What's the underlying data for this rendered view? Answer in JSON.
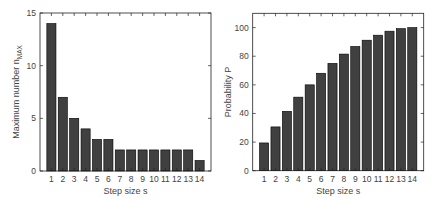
{
  "chart_data": [
    {
      "type": "bar",
      "title": "",
      "xlabel": "Step size s",
      "ylabel": "Maximum number n",
      "ylabel_subscript": "MAX",
      "categories": [
        "1",
        "2",
        "3",
        "4",
        "5",
        "6",
        "7",
        "8",
        "9",
        "10",
        "11",
        "12",
        "13",
        "14"
      ],
      "values": [
        14,
        7,
        5,
        4,
        3,
        3,
        2,
        2,
        2,
        2,
        2,
        2,
        2,
        1
      ],
      "ylim": [
        0,
        15
      ],
      "yticks": [
        0,
        5,
        10,
        15
      ],
      "xlim": [
        0,
        15
      ],
      "grid": false,
      "legend": null,
      "bar_color": "#404040",
      "edge_color": "#000000"
    },
    {
      "type": "bar",
      "title": "",
      "xlabel": "Step size s",
      "ylabel": "Probability P",
      "categories": [
        "1",
        "2",
        "3",
        "4",
        "5",
        "6",
        "7",
        "8",
        "9",
        "10",
        "11",
        "12",
        "13",
        "14"
      ],
      "values": [
        19.4,
        30.6,
        41.5,
        51.4,
        60.0,
        68.1,
        75.0,
        81.5,
        86.8,
        91.2,
        94.7,
        97.5,
        99.3,
        100
      ],
      "ylim": [
        0,
        110
      ],
      "yticks": [
        0,
        20,
        40,
        60,
        80,
        100
      ],
      "xlim": [
        0,
        15
      ],
      "grid": false,
      "legend": null,
      "bar_color": "#404040",
      "edge_color": "#000000"
    }
  ]
}
